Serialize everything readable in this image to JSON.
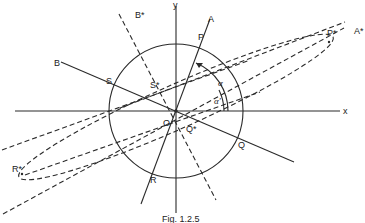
{
  "figure": {
    "caption": "Fig. 1.2.5",
    "axes": {
      "x_label": "x",
      "y_label": "y"
    },
    "origin_label": "O",
    "lines": {
      "A": "A",
      "B": "B",
      "A_star": "A*",
      "B_star": "B*"
    },
    "points": {
      "P": "P",
      "Q": "Q",
      "R": "R",
      "S": "S",
      "P_star": "P*",
      "Q_star": "Q*",
      "R_star": "R*",
      "S_star": "S*"
    },
    "angles": {
      "alpha": "α",
      "alpha_prime": "α'"
    },
    "colors": {
      "stroke": "#2a2a2a",
      "background": "#ffffff"
    }
  }
}
